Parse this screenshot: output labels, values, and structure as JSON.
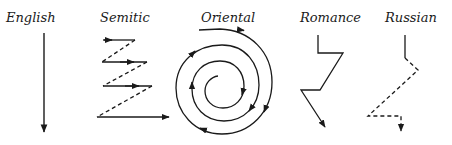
{
  "diagram": {
    "stroke_color": "#1a1a1a",
    "panels": [
      {
        "id": "english",
        "label": "English",
        "pattern": "straight line downward"
      },
      {
        "id": "semitic",
        "label": "Semitic",
        "pattern": "zigzag of parallel rightward arrows joined by dashed diagonals"
      },
      {
        "id": "oriental",
        "label": "Oriental",
        "pattern": "inward clockwise spiral"
      },
      {
        "id": "romance",
        "label": "Romance",
        "pattern": "zigzag with digressions"
      },
      {
        "id": "russian",
        "label": "Russian",
        "pattern": "solid start then dashed digressive path"
      }
    ]
  }
}
